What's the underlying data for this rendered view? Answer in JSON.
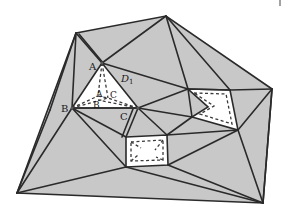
{
  "diagram": {
    "type": "constrained triangulation with polygonal holes",
    "fill_color": "#c8c8c8",
    "hole_color": "#ffffff",
    "edge_color": "#2a2a2a",
    "labels": {
      "A_outer": "A",
      "B_outer": "B",
      "C_outer": "C",
      "A_inner": "A",
      "B_inner": "B",
      "C_inner": "C",
      "D": "D",
      "D_sub": "1"
    },
    "outer_boundary": [
      [
        76,
        33
      ],
      [
        166,
        16
      ],
      [
        272,
        89
      ],
      [
        263,
        203
      ],
      [
        17,
        193
      ]
    ],
    "holes": [
      {
        "name": "triangle-hole-ABC",
        "points": [
          [
            102,
            63
          ],
          [
            72,
            108
          ],
          [
            138,
            108
          ]
        ]
      },
      {
        "name": "right-pocket-hole",
        "points": [
          [
            188,
            89
          ],
          [
            230,
            90
          ],
          [
            238,
            130
          ],
          [
            192,
            117
          ],
          [
            208,
            107
          ]
        ]
      },
      {
        "name": "bottom-box-hole",
        "points": [
          [
            126,
            137
          ],
          [
            167,
            135
          ],
          [
            168,
            165
          ],
          [
            126,
            167
          ]
        ]
      }
    ]
  }
}
